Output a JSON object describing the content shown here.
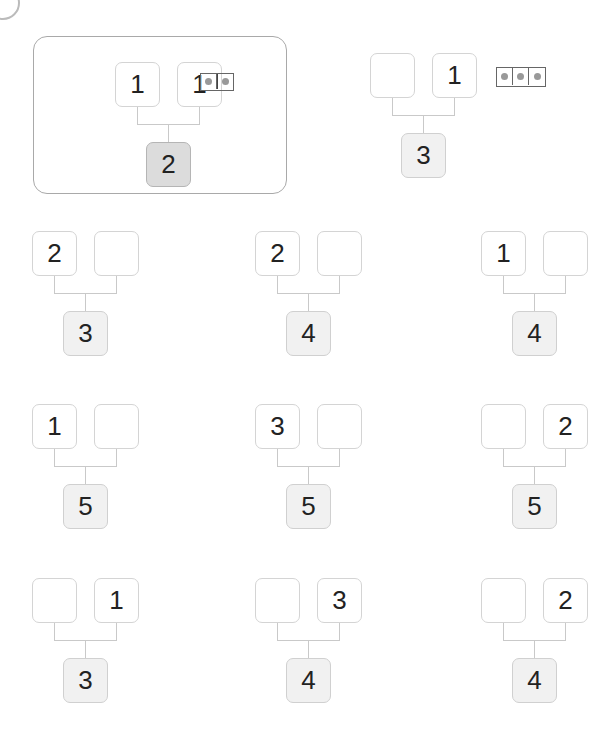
{
  "worksheet": {
    "example": {
      "parts": [
        "1",
        "1"
      ],
      "whole": "2",
      "counter_dots": 2
    },
    "prompt": {
      "parts": [
        "",
        "1"
      ],
      "whole": "3",
      "counter_dots": 3
    },
    "problems": [
      {
        "parts": [
          "2",
          ""
        ],
        "whole": "3"
      },
      {
        "parts": [
          "2",
          ""
        ],
        "whole": "4"
      },
      {
        "parts": [
          "1",
          ""
        ],
        "whole": "4"
      },
      {
        "parts": [
          "1",
          ""
        ],
        "whole": "5"
      },
      {
        "parts": [
          "3",
          ""
        ],
        "whole": "5"
      },
      {
        "parts": [
          "",
          "2"
        ],
        "whole": "5"
      },
      {
        "parts": [
          "",
          "1"
        ],
        "whole": "3"
      },
      {
        "parts": [
          "",
          "3"
        ],
        "whole": "4"
      },
      {
        "parts": [
          "",
          "2"
        ],
        "whole": "4"
      }
    ]
  }
}
